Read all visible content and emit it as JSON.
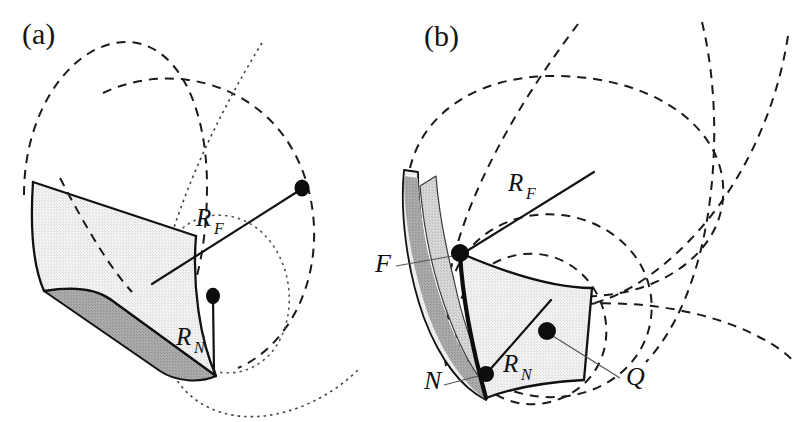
{
  "figure": {
    "caption_id": "principal-curvature-surfaces",
    "background_color": "#ffffff",
    "width": 796,
    "height": 422,
    "panels": [
      {
        "id": "a",
        "label": "(a)",
        "label_x": 22,
        "label_y": 44,
        "description": "Cylindrical developable strip with far and near principal curvature radii",
        "annotations": [
          {
            "name": "R_F",
            "base": "R",
            "subscript": "F",
            "x": 196,
            "y": 226,
            "sub_dx": 18,
            "sub_dy": 8
          },
          {
            "name": "R_N",
            "base": "R",
            "subscript": "N",
            "x": 176,
            "y": 345,
            "sub_dx": 18,
            "sub_dy": 8
          }
        ]
      },
      {
        "id": "b",
        "label": "(b)",
        "label_x": 424,
        "label_y": 46,
        "description": "Doubly curved patch with labelled points F, N and Q and principal radii",
        "annotations": [
          {
            "name": "R_F",
            "base": "R",
            "subscript": "F",
            "x": 508,
            "y": 191,
            "sub_dx": 18,
            "sub_dy": 8
          },
          {
            "name": "R_N",
            "base": "R",
            "subscript": "N",
            "x": 503,
            "y": 372,
            "sub_dx": 18,
            "sub_dy": 8
          },
          {
            "name": "F",
            "base": "F",
            "subscript": "",
            "x": 375,
            "y": 272,
            "sub_dx": 0,
            "sub_dy": 0
          },
          {
            "name": "N",
            "base": "N",
            "subscript": "",
            "x": 424,
            "y": 389,
            "sub_dx": 0,
            "sub_dy": 0
          },
          {
            "name": "Q",
            "base": "Q",
            "subscript": "",
            "x": 626,
            "y": 385,
            "sub_dx": 0,
            "sub_dy": 0
          }
        ]
      }
    ],
    "colors": {
      "stroke": "#111111",
      "surface_light": "#ececec",
      "surface_mid": "#d6d6d6",
      "surface_dark": "#a9a9a9",
      "leader": "#555555",
      "dot": "#0d0d0d"
    },
    "strokes": {
      "solid_width": 2.2,
      "thick_width": 4.0,
      "dashed_width": 2.0,
      "dashed_pattern": "9,7",
      "dotted_width": 1.6,
      "dotted_pattern": "2.5,4",
      "leader_width": 1.2
    },
    "markers": [
      {
        "name": "center-far-a",
        "panel": "a",
        "cx": 302,
        "cy": 188,
        "r": 7.5
      },
      {
        "name": "center-near-a",
        "panel": "a",
        "cx": 213,
        "cy": 296,
        "r": 7.0
      },
      {
        "name": "point-F-b",
        "panel": "b",
        "cx": 460,
        "cy": 253,
        "r": 9.0
      },
      {
        "name": "point-N-b",
        "panel": "b",
        "cx": 486,
        "cy": 374,
        "r": 8.0
      },
      {
        "name": "point-Q-b",
        "panel": "b",
        "cx": 547,
        "cy": 331,
        "r": 9.0
      }
    ]
  }
}
